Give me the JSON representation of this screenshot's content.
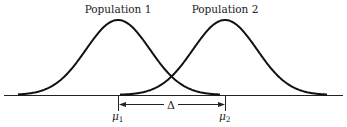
{
  "diagram": {
    "curves": [
      {
        "label": "Population 1",
        "mean_label": "μ",
        "mean_sub": "1"
      },
      {
        "label": "Population 2",
        "mean_label": "μ",
        "mean_sub": "2"
      }
    ],
    "difference_label": "Δ",
    "line_color": "#111111"
  }
}
